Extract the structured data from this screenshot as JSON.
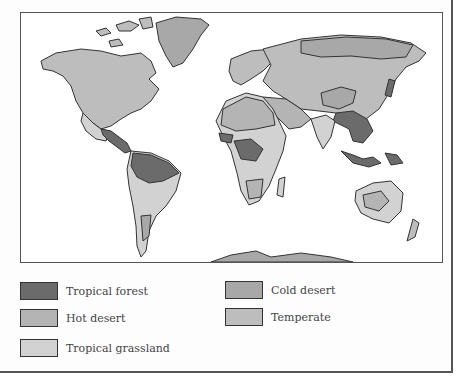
{
  "map": {
    "title": "World biomes map",
    "colors": {
      "tropical_forest": "#6b6b6b",
      "hot_desert": "#b4b4b4",
      "tropical_grassland": "#d2d2d2",
      "cold_desert": "#a8a8a8",
      "temperate": "#bdbdbd",
      "outline": "#333333",
      "ocean": "#ffffff"
    }
  },
  "legend": {
    "items": [
      {
        "label": "Tropical forest",
        "color": "#6b6b6b"
      },
      {
        "label": "Hot desert",
        "color": "#b4b4b4"
      },
      {
        "label": "Tropical grassland",
        "color": "#d2d2d2"
      },
      {
        "label": "Cold desert",
        "color": "#a8a8a8"
      },
      {
        "label": "Temperate",
        "color": "#bdbdbd"
      }
    ]
  }
}
